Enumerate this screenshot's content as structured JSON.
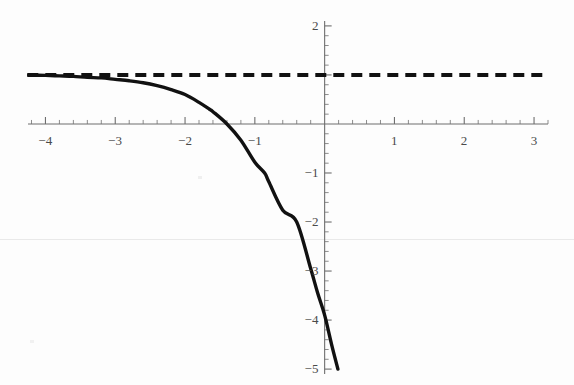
{
  "chart_data": {
    "type": "line",
    "title": "",
    "subtitle": "",
    "xlabel": "",
    "ylabel": "",
    "xlim": [
      -4.25,
      3.2
    ],
    "ylim": [
      -5.1,
      2.1
    ],
    "grid": false,
    "legend": null,
    "x_ticks": [
      -4,
      -3,
      -2,
      -1,
      1,
      2,
      3
    ],
    "x_tick_labels": [
      "-4",
      "-3",
      "-2",
      "-1",
      "1",
      "2",
      "3"
    ],
    "x_minor_tick_step": 0.2,
    "y_ticks": [
      2,
      -1,
      -2,
      -3,
      -4,
      -5
    ],
    "y_tick_labels": [
      "2",
      "-1",
      "-2",
      "-3",
      "-4",
      "-5"
    ],
    "y_minor_tick_step": 0.2,
    "axis_origin": [
      0,
      0
    ],
    "series": [
      {
        "name": "curve",
        "style": "solid",
        "color": "#111111",
        "width": 3.4,
        "description": "exponential decay approaching horizontal asymptote y = 1 from below as x decreases; falls steeply near x = 0",
        "x": [
          -4.24,
          -4.0,
          -3.8,
          -3.6,
          -3.4,
          -3.2,
          -3.0,
          -2.8,
          -2.6,
          -2.4,
          -2.2,
          -2.0,
          -1.8,
          -1.65,
          -1.6,
          -1.4,
          -1.2,
          -1.0,
          -0.86,
          -0.8,
          -0.6,
          -0.4,
          -0.2,
          -0.1,
          0.0,
          0.1,
          0.19
        ],
        "y": [
          1.0,
          0.99,
          0.98,
          0.97,
          0.95,
          0.94,
          0.91,
          0.88,
          0.84,
          0.78,
          0.7,
          0.6,
          0.44,
          0.3,
          0.25,
          0.0,
          -0.33,
          -0.78,
          -1.0,
          -1.18,
          -1.76,
          -2.0,
          -2.95,
          -3.45,
          -3.9,
          -4.5,
          -5.0
        ]
      },
      {
        "name": "asymptote",
        "style": "dashed",
        "color": "#111111",
        "width": 4.0,
        "description": "horizontal dashed asymptote line at y = 1 spanning the full plot width",
        "x": [
          -4.26,
          3.19
        ],
        "y": [
          1,
          1
        ]
      }
    ],
    "annotations": [],
    "asymptote_value": 1
  },
  "figure": {
    "background_color": "#fdfdfd",
    "axis_color": "#6e6e6e",
    "curve_color": "#111111",
    "label_color": "#4a4a4a",
    "width_px": 574,
    "height_px": 385
  }
}
